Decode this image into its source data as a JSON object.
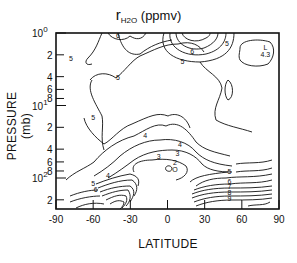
{
  "chart_data": {
    "type": "contour",
    "title_parts": {
      "symbol": "r",
      "subscript": "H2O",
      "units": "(ppmv)"
    },
    "xlabel": "LATITUDE",
    "ylabel": "PRESSURE (mb)",
    "xlim": [
      -90,
      90
    ],
    "ylim": [
      200,
      1
    ],
    "yscale": "log",
    "y_inverted": true,
    "x_ticks": [
      "-90",
      "-60",
      "-30",
      "0",
      "30",
      "60",
      "90"
    ],
    "y_major_ticks": [
      {
        "value": 1,
        "label_base": "10",
        "label_exp": "0"
      },
      {
        "value": 10,
        "label_base": "10",
        "label_exp": "1"
      },
      {
        "value": 100,
        "label_base": "10",
        "label_exp": "2"
      }
    ],
    "y_minor_ticks": [
      {
        "value": 2,
        "label": "2"
      },
      {
        "value": 4,
        "label": "4"
      },
      {
        "value": 6,
        "label": "6"
      },
      {
        "value": 8,
        "label": "8"
      },
      {
        "value": 20,
        "label": "2"
      },
      {
        "value": 40,
        "label": "4"
      },
      {
        "value": 60,
        "label": "6"
      },
      {
        "value": 80,
        "label": "8"
      },
      {
        "value": 200,
        "label": "2"
      }
    ],
    "grid": false,
    "contour_levels": [
      2,
      3,
      4,
      5,
      6,
      7,
      8,
      9
    ],
    "contour_labels": [
      {
        "text": "6",
        "lat": -40,
        "p": 1.1
      },
      {
        "text": "5",
        "lat": -78,
        "p": 2.3
      },
      {
        "text": "5",
        "lat": -40,
        "p": 4.2
      },
      {
        "text": "5",
        "lat": 12,
        "p": 2.5
      },
      {
        "text": "6",
        "lat": 20,
        "p": 1.8
      },
      {
        "text": "5",
        "lat": 48,
        "p": 1.4
      },
      {
        "text": "L",
        "lat": 79,
        "p": 1.6
      },
      {
        "text": "4.3",
        "lat": 79,
        "p": 2.0
      },
      {
        "text": "5",
        "lat": -60,
        "p": 15
      },
      {
        "text": "4",
        "lat": -18,
        "p": 26
      },
      {
        "text": "4",
        "lat": 10,
        "p": 35
      },
      {
        "text": "3",
        "lat": -7,
        "p": 52
      },
      {
        "text": "3",
        "lat": 8,
        "p": 46
      },
      {
        "text": "2",
        "lat": 6,
        "p": 62
      },
      {
        "text": "O",
        "lat": 6,
        "p": 78
      },
      {
        "text": "4",
        "lat": -48,
        "p": 95
      },
      {
        "text": "5",
        "lat": -60,
        "p": 122
      },
      {
        "text": "6",
        "lat": -58,
        "p": 145
      },
      {
        "text": "5",
        "lat": 50,
        "p": 82
      },
      {
        "text": "6",
        "lat": 50,
        "p": 112
      },
      {
        "text": "7",
        "lat": 50,
        "p": 135
      },
      {
        "text": "8",
        "lat": 50,
        "p": 160
      },
      {
        "text": "9",
        "lat": 50,
        "p": 195
      }
    ],
    "features": {
      "minimum": {
        "label": "O",
        "lat": 6,
        "p": 78,
        "note": "dry tropical tropopause minimum (~2 ppmv contour)"
      },
      "local_low": {
        "label": "L",
        "value": 4.3,
        "lat": 79,
        "p": 1.8
      },
      "upper_max": {
        "value": 6,
        "lat": 20,
        "p": 1.2,
        "note": "closed contours near top around 10-30N"
      },
      "steep_gradient": "tightly packed contours (5-9+) below ~100 mb near 30S and 30N"
    }
  }
}
